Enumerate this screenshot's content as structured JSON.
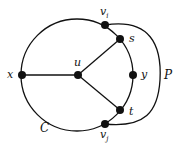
{
  "diagram": {
    "type": "graph",
    "nodes": [
      {
        "id": "vi",
        "label": "v",
        "sub": "i"
      },
      {
        "id": "s",
        "label": "s"
      },
      {
        "id": "x",
        "label": "x"
      },
      {
        "id": "u",
        "label": "u"
      },
      {
        "id": "y",
        "label": "y"
      },
      {
        "id": "t",
        "label": "t"
      },
      {
        "id": "vj",
        "label": "v",
        "sub": "j"
      }
    ],
    "edges": [
      [
        "u",
        "x"
      ],
      [
        "u",
        "s"
      ],
      [
        "u",
        "t"
      ]
    ],
    "cycle_label": "C",
    "path_label": "P",
    "colors": {
      "stroke": "#111111",
      "node": "#111111",
      "background": "#ffffff"
    }
  }
}
